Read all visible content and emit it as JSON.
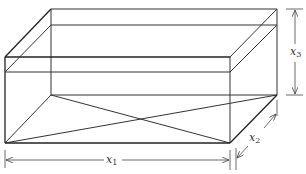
{
  "diagram": {
    "type": "rectangular-box-perspective",
    "labels": {
      "x1": {
        "base": "x",
        "sub": "1"
      },
      "x2": {
        "base": "x",
        "sub": "2"
      },
      "x3": {
        "base": "x",
        "sub": "3"
      }
    },
    "colors": {
      "line": "#333333",
      "background": "#ffffff"
    }
  }
}
